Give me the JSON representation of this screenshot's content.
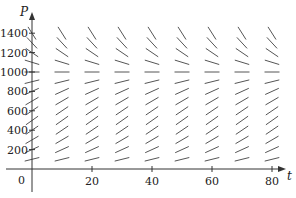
{
  "chart_data": {
    "type": "slope_field",
    "title": "",
    "xlabel": "t",
    "ylabel": "P",
    "xlim": [
      0,
      85
    ],
    "ylim": [
      0,
      1450
    ],
    "grid": false,
    "legend": null,
    "x_ticks": [
      {
        "value": 20,
        "label": "20"
      },
      {
        "value": 40,
        "label": "40"
      },
      {
        "value": 60,
        "label": "60"
      },
      {
        "value": 80,
        "label": "80"
      }
    ],
    "y_ticks": [
      {
        "value": 200,
        "label": "200"
      },
      {
        "value": 400,
        "label": "400"
      },
      {
        "value": 600,
        "label": "600"
      },
      {
        "value": 800,
        "label": "800"
      },
      {
        "value": 1000,
        "label": "1000"
      },
      {
        "value": 1200,
        "label": "1200"
      },
      {
        "value": 1400,
        "label": "1400"
      }
    ],
    "origin_label": "0",
    "field_t_values": [
      0,
      10,
      20,
      30,
      40,
      50,
      60,
      70,
      80
    ],
    "field_P_values": [
      100,
      200,
      300,
      400,
      500,
      600,
      700,
      800,
      900,
      1000,
      1100,
      1200,
      1300,
      1400
    ],
    "equilibrium_P": 1000,
    "slope_model": "dP/dt = k P (1 - P/1000)",
    "segment_color": "#555555"
  }
}
